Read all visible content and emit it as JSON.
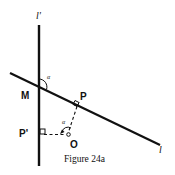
{
  "figure": {
    "caption": "Figure 24a",
    "colors": {
      "ink": "#111111",
      "background": "#ffffff"
    }
  },
  "labels": {
    "line_l_prime": "l'",
    "line_l": "l",
    "point_M": "M",
    "point_P": "P",
    "point_P_prime": "P'",
    "point_O": "O",
    "angle_alpha_top": "α",
    "angle_alpha_bottom": "α"
  },
  "elements": {
    "line_l_prime": {
      "type": "solid-line",
      "orientation": "vertical"
    },
    "line_l": {
      "type": "solid-line",
      "orientation": "descending"
    },
    "segment_OP": {
      "type": "dashed-line",
      "perpendicular_to": "l"
    },
    "segment_OP_prime": {
      "type": "dashed-line",
      "perpendicular_to": "l'"
    }
  }
}
